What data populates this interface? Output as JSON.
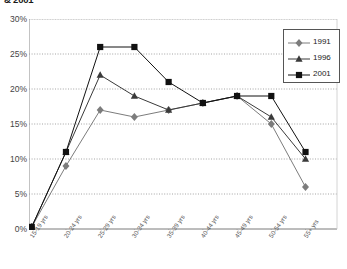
{
  "title": "& 2001",
  "legend": {
    "position": "top-right",
    "entries": [
      {
        "label": "1991",
        "marker": "diamond",
        "color": "#7c7c7c"
      },
      {
        "label": "1996",
        "marker": "triangle",
        "color": "#3a3a3a"
      },
      {
        "label": "2001",
        "marker": "square",
        "color": "#111111"
      }
    ]
  },
  "chart_data": {
    "type": "line",
    "title": "& 2001",
    "xlabel": "",
    "ylabel": "",
    "ylim": [
      0,
      30
    ],
    "yticks": [
      "0%",
      "5%",
      "10%",
      "15%",
      "20%",
      "25%",
      "30%"
    ],
    "ytick_values": [
      0,
      5,
      10,
      15,
      20,
      25,
      30
    ],
    "grid": true,
    "categories": [
      "15-19 yrs",
      "20-24 yrs",
      "25-29 yrs",
      "30-34 yrs",
      "35-39 yrs",
      "40-44 yrs",
      "45-49 yrs",
      "50-54 yrs",
      "55+ yrs"
    ],
    "series": [
      {
        "name": "1991",
        "marker": "diamond",
        "color": "#7c7c7c",
        "values": [
          0.3,
          9,
          17,
          16,
          17,
          18,
          19,
          15,
          6
        ]
      },
      {
        "name": "1996",
        "marker": "triangle",
        "color": "#3a3a3a",
        "values": [
          0.3,
          11,
          22,
          19,
          17,
          18,
          19,
          16,
          10
        ]
      },
      {
        "name": "2001",
        "marker": "square",
        "color": "#111111",
        "values": [
          0.3,
          11,
          26,
          26,
          21,
          18,
          19,
          19,
          11
        ]
      }
    ]
  }
}
